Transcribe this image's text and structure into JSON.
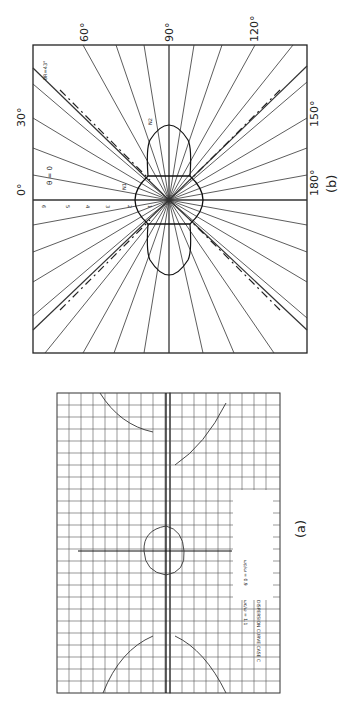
{
  "figure": {
    "panel_b": {
      "caption": "(b)",
      "angle_labels": {
        "a0": "0°",
        "a30": "30°",
        "a60": "60°",
        "a90": "90°",
        "a120": "120°",
        "a150": "150°",
        "a180": "180°"
      },
      "theta_label": "θ = 0",
      "theta_r_label": "θR=43°",
      "curve_labels": {
        "n1": "N1",
        "n2": "N2"
      },
      "radial_ticks": [
        "1",
        "2",
        "3",
        "4",
        "5",
        "6"
      ]
    },
    "panel_a": {
      "caption": "(a)",
      "annotation_title": "DISPERSION CURVE CASE C",
      "annotation_params": [
        "ωp/ω = 0.9",
        "ωc/ω = 1.1"
      ]
    }
  }
}
